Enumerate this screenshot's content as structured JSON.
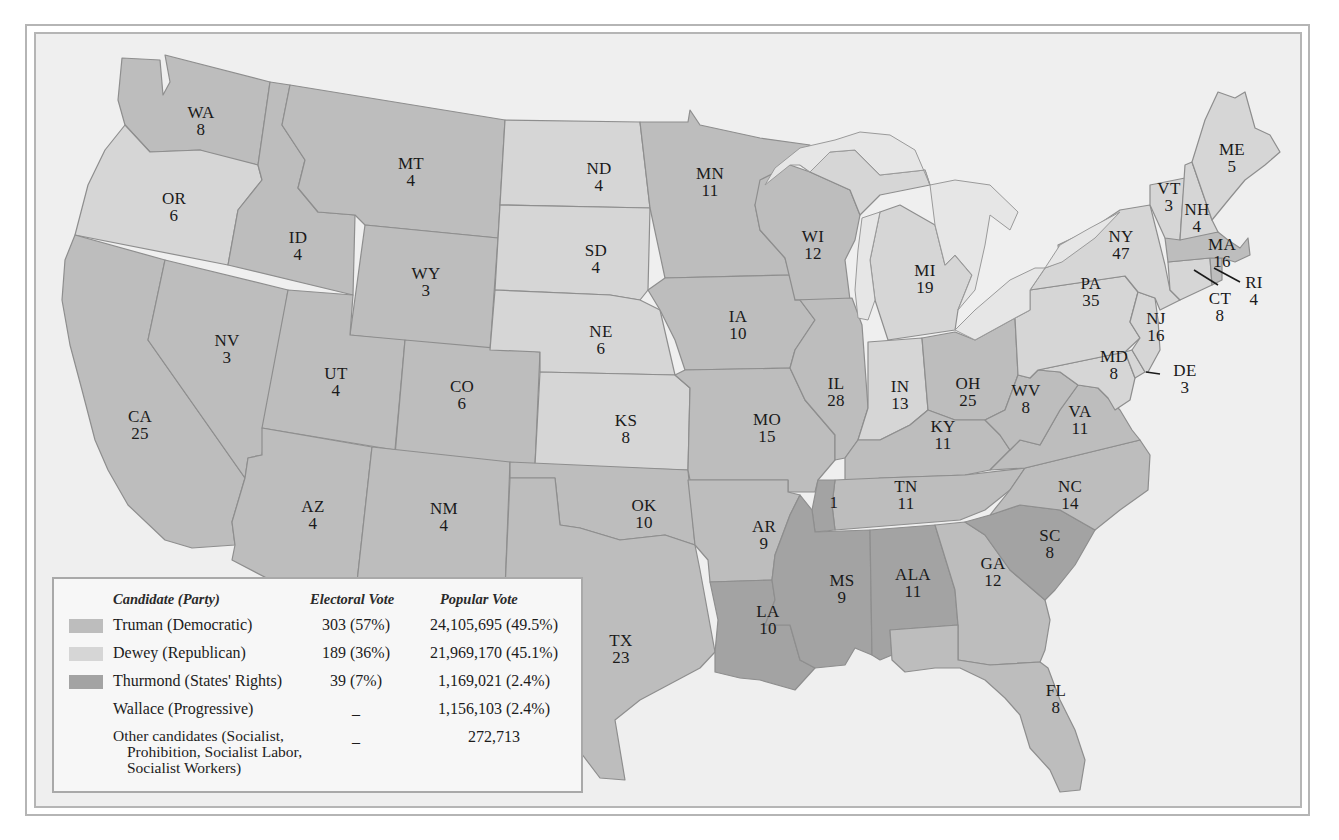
{
  "map": {
    "title": "1948 Presidential Election",
    "colors": {
      "truman": "#bdbdbd",
      "dewey": "#d6d6d6",
      "thurmond": "#a3a3a3",
      "water": "#efefef",
      "lakes": "#e6e6e6",
      "border": "#b5b5b5"
    },
    "states": [
      {
        "abbr": "WA",
        "votes": "8",
        "party": "truman"
      },
      {
        "abbr": "OR",
        "votes": "6",
        "party": "dewey"
      },
      {
        "abbr": "CA",
        "votes": "25",
        "party": "truman"
      },
      {
        "abbr": "NV",
        "votes": "3",
        "party": "truman"
      },
      {
        "abbr": "ID",
        "votes": "4",
        "party": "truman"
      },
      {
        "abbr": "MT",
        "votes": "4",
        "party": "truman"
      },
      {
        "abbr": "WY",
        "votes": "3",
        "party": "truman"
      },
      {
        "abbr": "UT",
        "votes": "4",
        "party": "truman"
      },
      {
        "abbr": "CO",
        "votes": "6",
        "party": "truman"
      },
      {
        "abbr": "AZ",
        "votes": "4",
        "party": "truman"
      },
      {
        "abbr": "NM",
        "votes": "4",
        "party": "truman"
      },
      {
        "abbr": "ND",
        "votes": "4",
        "party": "dewey"
      },
      {
        "abbr": "SD",
        "votes": "4",
        "party": "dewey"
      },
      {
        "abbr": "NE",
        "votes": "6",
        "party": "dewey"
      },
      {
        "abbr": "KS",
        "votes": "8",
        "party": "dewey"
      },
      {
        "abbr": "OK",
        "votes": "10",
        "party": "truman"
      },
      {
        "abbr": "TX",
        "votes": "23",
        "party": "truman"
      },
      {
        "abbr": "MN",
        "votes": "11",
        "party": "truman"
      },
      {
        "abbr": "IA",
        "votes": "10",
        "party": "truman"
      },
      {
        "abbr": "MO",
        "votes": "15",
        "party": "truman"
      },
      {
        "abbr": "AR",
        "votes": "9",
        "party": "truman"
      },
      {
        "abbr": "LA",
        "votes": "10",
        "party": "thurmond"
      },
      {
        "abbr": "WI",
        "votes": "12",
        "party": "truman"
      },
      {
        "abbr": "IL",
        "votes": "28",
        "party": "truman"
      },
      {
        "abbr": "MI",
        "votes": "19",
        "party": "dewey"
      },
      {
        "abbr": "IN",
        "votes": "13",
        "party": "dewey"
      },
      {
        "abbr": "OH",
        "votes": "25",
        "party": "truman"
      },
      {
        "abbr": "KY",
        "votes": "11",
        "party": "truman"
      },
      {
        "abbr": "TN",
        "votes": "11",
        "party": "truman"
      },
      {
        "abbr": "TN-split",
        "votes": "1",
        "party": "thurmond"
      },
      {
        "abbr": "MS",
        "votes": "9",
        "party": "thurmond"
      },
      {
        "abbr": "ALA",
        "votes": "11",
        "party": "thurmond"
      },
      {
        "abbr": "GA",
        "votes": "12",
        "party": "truman"
      },
      {
        "abbr": "FL",
        "votes": "8",
        "party": "truman"
      },
      {
        "abbr": "SC",
        "votes": "8",
        "party": "thurmond"
      },
      {
        "abbr": "NC",
        "votes": "14",
        "party": "truman"
      },
      {
        "abbr": "VA",
        "votes": "11",
        "party": "truman"
      },
      {
        "abbr": "WV",
        "votes": "8",
        "party": "truman"
      },
      {
        "abbr": "MD",
        "votes": "8",
        "party": "dewey"
      },
      {
        "abbr": "DE",
        "votes": "3",
        "party": "dewey"
      },
      {
        "abbr": "PA",
        "votes": "35",
        "party": "dewey"
      },
      {
        "abbr": "NJ",
        "votes": "16",
        "party": "dewey"
      },
      {
        "abbr": "NY",
        "votes": "47",
        "party": "dewey"
      },
      {
        "abbr": "CT",
        "votes": "8",
        "party": "dewey"
      },
      {
        "abbr": "RI",
        "votes": "4",
        "party": "truman"
      },
      {
        "abbr": "MA",
        "votes": "16",
        "party": "truman"
      },
      {
        "abbr": "VT",
        "votes": "3",
        "party": "dewey"
      },
      {
        "abbr": "NH",
        "votes": "4",
        "party": "dewey"
      },
      {
        "abbr": "ME",
        "votes": "5",
        "party": "dewey"
      }
    ]
  },
  "legend": {
    "headers": {
      "candidate": "Candidate (Party)",
      "electoral": "Electoral Vote",
      "popular": "Popular Vote"
    },
    "rows": [
      {
        "candidate": "Truman (Democratic)",
        "electoral": "303 (57%)",
        "popular": "24,105,695 (49.5%)",
        "swatch": "truman"
      },
      {
        "candidate": "Dewey (Republican)",
        "electoral": "189 (36%)",
        "popular": "21,969,170 (45.1%)",
        "swatch": "dewey"
      },
      {
        "candidate": "Thurmond (States' Rights)",
        "electoral": "39 (7%)",
        "popular": "1,169,021 (2.4%)",
        "swatch": "thurmond"
      },
      {
        "candidate": "Wallace (Progressive)",
        "electoral": "_",
        "popular": "1,156,103 (2.4%)",
        "swatch": null
      },
      {
        "candidate_lines": [
          "Other candidates (Socialist,",
          "Prohibition, Socialist Labor,",
          "Socialist Workers)"
        ],
        "electoral": "_",
        "popular": "272,713",
        "swatch": null
      }
    ]
  }
}
